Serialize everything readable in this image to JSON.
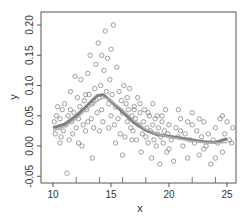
{
  "chart_data": {
    "type": "scatter",
    "title": "",
    "xlabel": "x",
    "ylabel": "y",
    "xlim": [
      9.0,
      25.8
    ],
    "ylim": [
      -0.062,
      0.215
    ],
    "x_ticks": [
      10,
      15,
      20,
      25
    ],
    "x_minor_ticks": [
      12,
      14,
      16,
      18,
      22,
      24
    ],
    "y_ticks": [
      -0.05,
      0.0,
      0.05,
      0.1,
      0.15,
      0.2
    ],
    "y_tick_labels": [
      "-0.05",
      "0.00",
      "0.05",
      "0.10",
      "0.15",
      "0.20"
    ],
    "grid": false,
    "legend": null,
    "colors": {
      "points": "#777777",
      "curve_main": "#808080",
      "curve_light": "#b0b0b0",
      "axis": "#555555"
    },
    "curves": [
      {
        "name": "smooth-fit",
        "x": [
          10,
          11,
          12,
          13,
          13.8,
          14.3,
          15,
          16,
          17,
          18,
          19,
          20,
          21,
          22,
          23,
          24,
          25
        ],
        "y": [
          0.03,
          0.036,
          0.05,
          0.068,
          0.083,
          0.085,
          0.074,
          0.056,
          0.038,
          0.026,
          0.019,
          0.016,
          0.013,
          0.01,
          0.007,
          0.006,
          0.012
        ]
      },
      {
        "name": "true-curve",
        "x": [
          10,
          11,
          12,
          13,
          14,
          14.5,
          15,
          16,
          17,
          18,
          19,
          20,
          21,
          22,
          23,
          24,
          25
        ],
        "y": [
          0.025,
          0.032,
          0.045,
          0.062,
          0.077,
          0.08,
          0.075,
          0.06,
          0.042,
          0.028,
          0.02,
          0.015,
          0.011,
          0.008,
          0.006,
          0.005,
          0.006
        ]
      }
    ],
    "points": [
      [
        10.1,
        0.04
      ],
      [
        10.2,
        0.02
      ],
      [
        10.3,
        0.05
      ],
      [
        10.4,
        0.065
      ],
      [
        10.5,
        0.03
      ],
      [
        10.6,
        0.045
      ],
      [
        10.7,
        0.015
      ],
      [
        10.8,
        0.06
      ],
      [
        10.9,
        0.025
      ],
      [
        11.0,
        0.07
      ],
      [
        11.1,
        0.035
      ],
      [
        11.2,
        -0.045
      ],
      [
        11.3,
        0.05
      ],
      [
        11.4,
        0.01
      ],
      [
        11.5,
        0.09
      ],
      [
        11.6,
        0.04
      ],
      [
        11.7,
        0.02
      ],
      [
        11.8,
        0.055
      ],
      [
        11.9,
        0.115
      ],
      [
        12.0,
        0.03
      ],
      [
        12.1,
        0.08
      ],
      [
        12.2,
        0.045
      ],
      [
        12.3,
        0.065
      ],
      [
        12.4,
        0.11
      ],
      [
        12.5,
        0.0
      ],
      [
        12.6,
        0.035
      ],
      [
        12.7,
        0.075
      ],
      [
        12.8,
        0.025
      ],
      [
        12.9,
        0.06
      ],
      [
        13.0,
        0.12
      ],
      [
        13.1,
        0.085
      ],
      [
        13.2,
        0.15
      ],
      [
        13.3,
        0.045
      ],
      [
        13.4,
        0.07
      ],
      [
        13.5,
        0.03
      ],
      [
        13.6,
        0.095
      ],
      [
        13.7,
        0.135
      ],
      [
        13.8,
        0.055
      ],
      [
        13.9,
        0.17
      ],
      [
        14.0,
        0.08
      ],
      [
        14.1,
        0.1
      ],
      [
        14.2,
        0.06
      ],
      [
        14.3,
        0.04
      ],
      [
        14.4,
        0.125
      ],
      [
        14.5,
        0.19
      ],
      [
        14.6,
        0.09
      ],
      [
        14.7,
        0.145
      ],
      [
        14.8,
        0.07
      ],
      [
        14.9,
        0.11
      ],
      [
        15.0,
        0.05
      ],
      [
        15.1,
        0.085
      ],
      [
        15.2,
        0.2
      ],
      [
        15.3,
        0.035
      ],
      [
        15.4,
        0.065
      ],
      [
        15.5,
        0.13
      ],
      [
        15.6,
        0.045
      ],
      [
        15.7,
        0.09
      ],
      [
        15.8,
        0.02
      ],
      [
        15.9,
        0.075
      ],
      [
        16.0,
        0.055
      ],
      [
        16.1,
        0.1
      ],
      [
        16.2,
        0.015
      ],
      [
        16.3,
        0.07
      ],
      [
        16.4,
        0.04
      ],
      [
        16.5,
        0.06
      ],
      [
        16.6,
        0.095
      ],
      [
        16.7,
        0.03
      ],
      [
        16.8,
        0.05
      ],
      [
        16.9,
        0.025
      ],
      [
        17.0,
        0.065
      ],
      [
        17.1,
        0.045
      ],
      [
        17.2,
        0.01
      ],
      [
        17.3,
        0.08
      ],
      [
        17.4,
        0.035
      ],
      [
        17.5,
        0.055
      ],
      [
        17.6,
        -0.01
      ],
      [
        17.7,
        0.02
      ],
      [
        17.8,
        0.04
      ],
      [
        17.9,
        0.06
      ],
      [
        18.0,
        0.015
      ],
      [
        18.1,
        0.03
      ],
      [
        18.2,
        0.005
      ],
      [
        18.3,
        0.05
      ],
      [
        18.4,
        0.025
      ],
      [
        18.5,
        -0.02
      ],
      [
        18.6,
        0.035
      ],
      [
        18.7,
        0.01
      ],
      [
        18.8,
        0.045
      ],
      [
        18.9,
        0.0
      ],
      [
        19.0,
        0.02
      ],
      [
        19.1,
        0.03
      ],
      [
        19.2,
        -0.03
      ],
      [
        19.3,
        0.015
      ],
      [
        19.4,
        0.04
      ],
      [
        19.5,
        0.005
      ],
      [
        19.6,
        0.025
      ],
      [
        19.7,
        0.06
      ],
      [
        19.8,
        -0.01
      ],
      [
        19.9,
        0.02
      ],
      [
        20.0,
        0.035
      ],
      [
        20.2,
        0.01
      ],
      [
        20.4,
        -0.025
      ],
      [
        20.6,
        0.03
      ],
      [
        20.8,
        0.015
      ],
      [
        21.0,
        0.045
      ],
      [
        21.2,
        0.0
      ],
      [
        21.4,
        0.02
      ],
      [
        21.6,
        -0.02
      ],
      [
        21.8,
        0.01
      ],
      [
        22.0,
        0.035
      ],
      [
        22.2,
        0.005
      ],
      [
        22.4,
        0.025
      ],
      [
        22.6,
        -0.015
      ],
      [
        22.8,
        0.015
      ],
      [
        23.0,
        0.04
      ],
      [
        23.2,
        0.0
      ],
      [
        23.4,
        0.02
      ],
      [
        23.6,
        -0.03
      ],
      [
        23.8,
        0.01
      ],
      [
        24.0,
        0.03
      ],
      [
        24.2,
        0.005
      ],
      [
        24.4,
        0.045
      ],
      [
        24.6,
        -0.01
      ],
      [
        24.8,
        0.02
      ],
      [
        25.0,
        0.04
      ],
      [
        25.2,
        0.01
      ],
      [
        25.4,
        0.005
      ],
      [
        25.5,
        0.03
      ],
      [
        10.6,
        0.005
      ],
      [
        11.5,
        0.06
      ],
      [
        12.2,
        0.005
      ],
      [
        13.0,
        0.04
      ],
      [
        13.5,
        0.075
      ],
      [
        14.0,
        0.025
      ],
      [
        14.8,
        0.03
      ],
      [
        15.4,
        0.005
      ],
      [
        16.0,
        -0.015
      ],
      [
        16.8,
        0.01
      ],
      [
        17.5,
        0.07
      ],
      [
        18.2,
        0.055
      ],
      [
        19.0,
        0.05
      ],
      [
        20.0,
        -0.005
      ],
      [
        21.0,
        0.025
      ],
      [
        22.0,
        0.055
      ],
      [
        23.0,
        -0.005
      ],
      [
        24.0,
        -0.02
      ],
      [
        12.8,
        0.085
      ],
      [
        14.2,
        0.15
      ],
      [
        15.0,
        0.16
      ],
      [
        13.4,
        -0.02
      ],
      [
        16.4,
        0.08
      ],
      [
        17.0,
        0.06
      ],
      [
        18.6,
        0.07
      ],
      [
        19.4,
        0.05
      ],
      [
        20.8,
        0.06
      ],
      [
        21.6,
        0.04
      ],
      [
        22.6,
        0.045
      ],
      [
        24.6,
        0.05
      ]
    ]
  }
}
